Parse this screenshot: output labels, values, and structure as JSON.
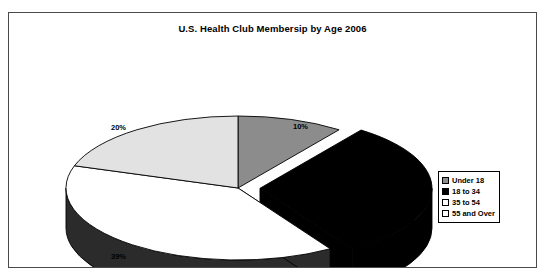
{
  "chart_data": {
    "type": "pie",
    "title": "U.S. Health Club Membersip by Age 2006",
    "xlabel": "",
    "ylabel": "",
    "legend_position": "right",
    "grid": false,
    "exploded_slice": "18 to 34",
    "categories": [
      "Under 18",
      "18 to 34",
      "35 to 54",
      "55 and Over"
    ],
    "values": [
      10,
      31,
      39,
      20
    ],
    "value_labels": [
      "10%",
      "31%",
      "39%",
      "20%"
    ],
    "slice_colors": [
      "#8c8c8c",
      "#000000",
      "#ffffff",
      "#e2e2e2"
    ],
    "slice_side_colors": [
      "#5c5c5c",
      "#000000",
      "#2b2b2b",
      "#2b2b2b"
    ]
  },
  "frame": {
    "border_color": "#4a4a4a",
    "background": "#ffffff"
  },
  "legend": {
    "items": [
      {
        "label": "Under 18",
        "swatch": "#8c8c8c"
      },
      {
        "label": "18 to 34",
        "swatch": "#000000"
      },
      {
        "label": "35 to 54",
        "swatch": "#ffffff"
      },
      {
        "label": "55 and Over",
        "swatch": "#ffffff"
      }
    ]
  },
  "labels": {
    "under18": "10%",
    "age18_34": "31%",
    "age35_54": "39%",
    "age55over": "20%"
  }
}
